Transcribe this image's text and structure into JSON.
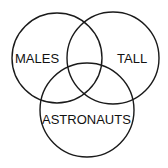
{
  "diagram": {
    "type": "venn",
    "stroke_color": "#1a1a1a",
    "background": "#ffffff",
    "sets": [
      {
        "label": "MALES",
        "cx": 57,
        "cy": 58,
        "r": 45,
        "label_x": 19,
        "label_y": 62
      },
      {
        "label": "TALL",
        "cx": 113,
        "cy": 58,
        "r": 46,
        "label_x": 119,
        "label_y": 62
      },
      {
        "label": "ASTRONAUTS",
        "cx": 87,
        "cy": 110,
        "r": 47,
        "label_x": 44,
        "label_y": 124
      }
    ]
  }
}
